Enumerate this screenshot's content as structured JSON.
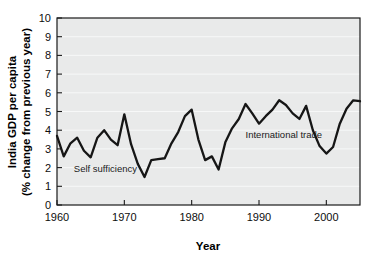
{
  "chart_data": {
    "type": "line",
    "title": "",
    "xlabel": "Year",
    "ylabel": "India GDP per capita (% change from previous year)",
    "ylabel_line1": "India GDP per capita",
    "ylabel_line2": "(% change from previous year)",
    "xlim": [
      1960,
      2005
    ],
    "ylim": [
      0,
      10
    ],
    "xticks": [
      1960,
      1970,
      1980,
      1990,
      2000
    ],
    "xtick_labels": [
      "1960",
      "1970",
      "1980",
      "1990",
      "2000"
    ],
    "yticks": [
      0,
      1,
      2,
      3,
      4,
      5,
      6,
      7,
      8,
      9,
      10
    ],
    "ytick_labels": [
      "0",
      "1",
      "2",
      "3",
      "4",
      "5",
      "6",
      "7",
      "8",
      "9",
      "10"
    ],
    "grid": true,
    "grid_axis": "y",
    "legend": false,
    "plot_background": "#e9eaea",
    "gridline_color": "#f7f8f8",
    "line_color": "#161616",
    "annotations": [
      {
        "text": "Self sufficiency",
        "x": 1962.5,
        "y": 1.75,
        "align": "left"
      },
      {
        "text": "International trade",
        "x": 1988.0,
        "y": 3.6,
        "align": "left"
      }
    ],
    "x": [
      1960,
      1961,
      1962,
      1963,
      1964,
      1965,
      1966,
      1967,
      1968,
      1969,
      1970,
      1971,
      1972,
      1973,
      1974,
      1975,
      1976,
      1977,
      1978,
      1979,
      1980,
      1981,
      1982,
      1983,
      1984,
      1985,
      1986,
      1987,
      1988,
      1989,
      1990,
      1991,
      1992,
      1993,
      1994,
      1995,
      1996,
      1997,
      1998,
      1999,
      2000,
      2001,
      2002,
      2003,
      2004,
      2005
    ],
    "values": [
      3.7,
      2.6,
      3.3,
      3.6,
      2.9,
      2.55,
      3.6,
      4.0,
      3.5,
      3.2,
      4.85,
      3.25,
      2.2,
      1.5,
      2.4,
      2.45,
      2.5,
      3.3,
      3.9,
      4.75,
      5.1,
      3.5,
      2.4,
      2.6,
      1.9,
      3.35,
      4.1,
      4.6,
      5.4,
      4.9,
      4.35,
      4.75,
      5.1,
      5.6,
      5.35,
      4.9,
      4.6,
      5.3,
      4.0,
      3.15,
      2.75,
      3.1,
      4.35,
      5.15,
      5.6,
      5.55
    ],
    "series_name": "India GDP per capita growth"
  }
}
